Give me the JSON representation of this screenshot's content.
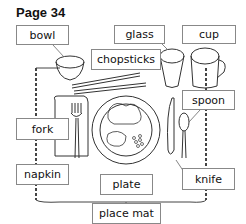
{
  "page": {
    "title": "Page 34"
  },
  "labels": {
    "bowl": "bowl",
    "glass": "glass",
    "cup": "cup",
    "chopsticks": "chopsticks",
    "spoon": "spoon",
    "fork": "fork",
    "napkin": "napkin",
    "plate": "plate",
    "knife": "knife",
    "place_mat": "place mat"
  }
}
